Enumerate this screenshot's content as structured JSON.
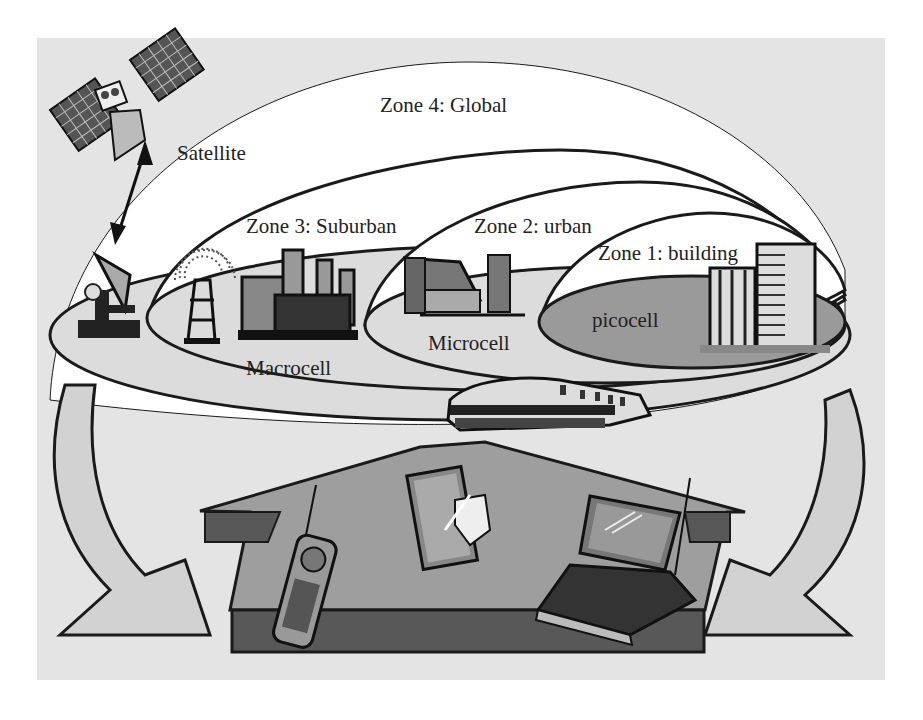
{
  "diagram": {
    "colors": {
      "page_bg": "#ffffff",
      "panel_bg": "#e4e4e4",
      "dome_fill": "#ffffff",
      "ground_light": "#dcdcdc",
      "picocell_fill": "#9a9a9a",
      "house_top": "#9e9e9e",
      "house_side": "#585858",
      "stroke": "#1a1a1a"
    },
    "zones": [
      {
        "id": "zone4",
        "label": "Zone 4: Global",
        "cell_label": "Satellite"
      },
      {
        "id": "zone3",
        "label": "Zone 3: Suburban",
        "cell_label": "Macrocell"
      },
      {
        "id": "zone2",
        "label": "Zone 2: urban",
        "cell_label": "Microcell"
      },
      {
        "id": "zone1",
        "label": "Zone 1: building",
        "cell_label": "picocell"
      }
    ],
    "icons": [
      {
        "name": "satellite-icon"
      },
      {
        "name": "satellite-dish-icon"
      },
      {
        "name": "radio-tower-icon"
      },
      {
        "name": "factory-icon"
      },
      {
        "name": "house-icon"
      },
      {
        "name": "office-building-icon"
      },
      {
        "name": "train-icon"
      },
      {
        "name": "mobile-phone-icon"
      },
      {
        "name": "pda-tablet-icon"
      },
      {
        "name": "laptop-icon"
      }
    ]
  }
}
